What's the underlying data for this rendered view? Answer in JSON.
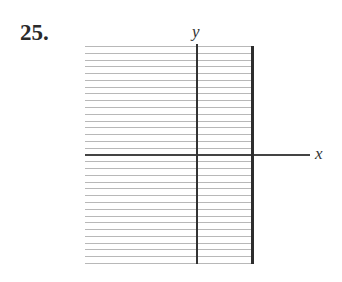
{
  "problem": {
    "number": "25."
  },
  "axes": {
    "x_label": "x",
    "y_label": "y"
  },
  "grid": {
    "rows": 32,
    "line_color": "#b8b8b8",
    "axis_color": "#333333"
  }
}
